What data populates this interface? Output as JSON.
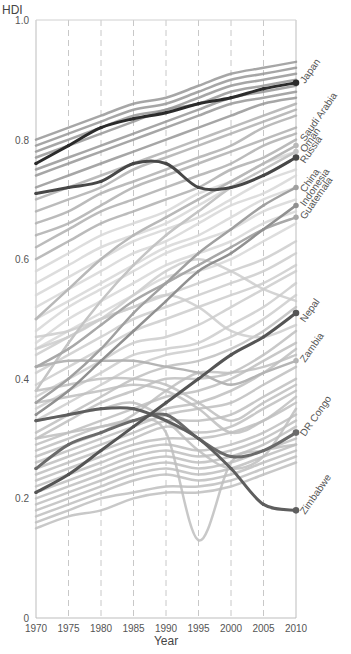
{
  "chart_data": {
    "type": "line",
    "title": "",
    "xlabel": "Year",
    "ylabel": "HDI",
    "xlim": [
      1970,
      2010
    ],
    "ylim": [
      0,
      1.0
    ],
    "x_ticks": [
      1970,
      1975,
      1980,
      1985,
      1990,
      1995,
      2000,
      2005,
      2010
    ],
    "y_ticks": [
      {
        "value": 0,
        "label": "0"
      },
      {
        "value": 0.2,
        "label": "0.2"
      },
      {
        "value": 0.4,
        "label": "0.4"
      },
      {
        "value": 0.6,
        "label": "0.6"
      },
      {
        "value": 0.8,
        "label": "0.8"
      },
      {
        "value": 1.0,
        "label": "1.0"
      }
    ],
    "grid": {
      "vertical_dashed": true,
      "horizontal": false
    },
    "legend": "direct labels at right end of highlighted lines, rotated 45°",
    "x": [
      1970,
      1975,
      1980,
      1985,
      1990,
      1995,
      2000,
      2005,
      2010
    ],
    "highlighted_series": [
      {
        "name": "Japan",
        "color": "#2b2b2b",
        "width": 3,
        "values": [
          0.76,
          0.79,
          0.82,
          0.835,
          0.845,
          0.86,
          0.87,
          0.885,
          0.895
        ]
      },
      {
        "name": "Saudi Arabia",
        "color": "#b8b8b8",
        "width": 2.5,
        "values": [
          0.5,
          0.55,
          0.6,
          0.64,
          0.67,
          0.7,
          0.73,
          0.76,
          0.79
        ]
      },
      {
        "name": "Oman",
        "color": "#c4c4c4",
        "width": 2.5,
        "values": [
          0.38,
          0.46,
          0.53,
          0.59,
          0.64,
          0.68,
          0.72,
          0.75,
          0.78
        ]
      },
      {
        "name": "Russia",
        "color": "#474747",
        "width": 3,
        "values": [
          0.71,
          0.72,
          0.73,
          0.76,
          0.76,
          0.72,
          0.72,
          0.74,
          0.77
        ]
      },
      {
        "name": "China",
        "color": "#a0a0a0",
        "width": 2.5,
        "values": [
          0.36,
          0.4,
          0.45,
          0.51,
          0.56,
          0.61,
          0.65,
          0.69,
          0.72
        ]
      },
      {
        "name": "Indonesia",
        "color": "#909090",
        "width": 2.5,
        "values": [
          0.34,
          0.38,
          0.43,
          0.48,
          0.53,
          0.58,
          0.61,
          0.65,
          0.69
        ]
      },
      {
        "name": "Guatemala",
        "color": "#a8a8a8",
        "width": 2.5,
        "values": [
          0.42,
          0.45,
          0.49,
          0.53,
          0.56,
          0.59,
          0.62,
          0.65,
          0.67
        ]
      },
      {
        "name": "Nepal",
        "color": "#555555",
        "width": 3,
        "values": [
          0.21,
          0.24,
          0.28,
          0.32,
          0.36,
          0.4,
          0.44,
          0.47,
          0.51
        ]
      },
      {
        "name": "Zambia",
        "color": "#b4b4b4",
        "width": 2.5,
        "values": [
          0.42,
          0.43,
          0.43,
          0.43,
          0.42,
          0.41,
          0.39,
          0.41,
          0.43
        ]
      },
      {
        "name": "DR Congo",
        "color": "#6b6b6b",
        "width": 3,
        "values": [
          0.25,
          0.29,
          0.31,
          0.33,
          0.34,
          0.3,
          0.27,
          0.28,
          0.31
        ]
      },
      {
        "name": "Zimbabwe",
        "color": "#5e5e5e",
        "width": 3,
        "values": [
          0.33,
          0.34,
          0.35,
          0.35,
          0.33,
          0.3,
          0.25,
          0.19,
          0.18
        ]
      }
    ],
    "highlight_markers_years": [
      1970,
      1975,
      1980,
      1985,
      1990,
      1995,
      2000,
      2005,
      2010
    ],
    "background_series_note": "many unlabeled gray lines for other countries, shaded from dark gray at top (high HDI) to light gray in middle",
    "background_series": [
      {
        "values": [
          0.8,
          0.82,
          0.84,
          0.86,
          0.87,
          0.89,
          0.91,
          0.92,
          0.93
        ]
      },
      {
        "values": [
          0.79,
          0.81,
          0.83,
          0.85,
          0.86,
          0.88,
          0.9,
          0.91,
          0.92
        ]
      },
      {
        "values": [
          0.78,
          0.8,
          0.82,
          0.84,
          0.85,
          0.87,
          0.89,
          0.9,
          0.91
        ]
      },
      {
        "values": [
          0.77,
          0.79,
          0.81,
          0.83,
          0.85,
          0.86,
          0.88,
          0.89,
          0.9
        ]
      },
      {
        "values": [
          0.75,
          0.77,
          0.79,
          0.81,
          0.83,
          0.85,
          0.87,
          0.88,
          0.89
        ]
      },
      {
        "values": [
          0.74,
          0.76,
          0.78,
          0.8,
          0.82,
          0.84,
          0.86,
          0.87,
          0.88
        ]
      },
      {
        "values": [
          0.72,
          0.74,
          0.76,
          0.78,
          0.8,
          0.82,
          0.84,
          0.86,
          0.87
        ]
      },
      {
        "values": [
          0.7,
          0.72,
          0.74,
          0.76,
          0.78,
          0.8,
          0.82,
          0.84,
          0.86
        ]
      },
      {
        "values": [
          0.68,
          0.7,
          0.72,
          0.75,
          0.77,
          0.79,
          0.81,
          0.83,
          0.85
        ]
      },
      {
        "values": [
          0.66,
          0.68,
          0.71,
          0.73,
          0.75,
          0.77,
          0.79,
          0.82,
          0.84
        ]
      },
      {
        "values": [
          0.64,
          0.66,
          0.69,
          0.72,
          0.74,
          0.76,
          0.78,
          0.8,
          0.82
        ]
      },
      {
        "values": [
          0.62,
          0.65,
          0.68,
          0.7,
          0.72,
          0.74,
          0.76,
          0.79,
          0.81
        ]
      },
      {
        "values": [
          0.6,
          0.63,
          0.66,
          0.68,
          0.7,
          0.72,
          0.75,
          0.77,
          0.8
        ]
      },
      {
        "values": [
          0.58,
          0.61,
          0.64,
          0.66,
          0.68,
          0.71,
          0.73,
          0.76,
          0.78
        ]
      },
      {
        "values": [
          0.56,
          0.59,
          0.62,
          0.64,
          0.66,
          0.69,
          0.72,
          0.74,
          0.77
        ]
      },
      {
        "values": [
          0.54,
          0.57,
          0.6,
          0.63,
          0.65,
          0.67,
          0.7,
          0.73,
          0.75
        ]
      },
      {
        "values": [
          0.52,
          0.55,
          0.58,
          0.61,
          0.63,
          0.66,
          0.69,
          0.71,
          0.74
        ]
      },
      {
        "values": [
          0.5,
          0.53,
          0.56,
          0.59,
          0.62,
          0.64,
          0.67,
          0.7,
          0.72
        ]
      },
      {
        "values": [
          0.48,
          0.52,
          0.55,
          0.58,
          0.61,
          0.63,
          0.65,
          0.68,
          0.7
        ]
      },
      {
        "values": [
          0.46,
          0.5,
          0.53,
          0.56,
          0.59,
          0.61,
          0.63,
          0.66,
          0.68
        ]
      },
      {
        "values": [
          0.45,
          0.48,
          0.51,
          0.54,
          0.57,
          0.58,
          0.6,
          0.63,
          0.66
        ]
      },
      {
        "values": [
          0.44,
          0.47,
          0.5,
          0.52,
          0.54,
          0.56,
          0.58,
          0.6,
          0.63
        ]
      },
      {
        "values": [
          0.41,
          0.44,
          0.47,
          0.5,
          0.52,
          0.54,
          0.56,
          0.58,
          0.61
        ]
      },
      {
        "values": [
          0.39,
          0.42,
          0.45,
          0.48,
          0.5,
          0.52,
          0.54,
          0.56,
          0.59
        ]
      },
      {
        "values": [
          0.37,
          0.4,
          0.43,
          0.46,
          0.47,
          0.49,
          0.52,
          0.55,
          0.58
        ]
      },
      {
        "values": [
          0.35,
          0.38,
          0.41,
          0.44,
          0.45,
          0.46,
          0.49,
          0.52,
          0.56
        ]
      },
      {
        "values": [
          0.33,
          0.36,
          0.39,
          0.42,
          0.44,
          0.45,
          0.47,
          0.5,
          0.54
        ]
      },
      {
        "values": [
          0.31,
          0.34,
          0.37,
          0.4,
          0.42,
          0.43,
          0.45,
          0.48,
          0.52
        ]
      },
      {
        "values": [
          0.3,
          0.33,
          0.36,
          0.38,
          0.4,
          0.4,
          0.41,
          0.44,
          0.48
        ]
      },
      {
        "values": [
          0.29,
          0.31,
          0.33,
          0.35,
          0.37,
          0.38,
          0.4,
          0.43,
          0.46
        ]
      },
      {
        "values": [
          0.28,
          0.3,
          0.32,
          0.33,
          0.35,
          0.36,
          0.38,
          0.41,
          0.45
        ]
      },
      {
        "values": [
          0.27,
          0.29,
          0.31,
          0.34,
          0.38,
          0.41,
          0.41,
          0.42,
          0.44
        ]
      },
      {
        "values": [
          0.26,
          0.28,
          0.3,
          0.32,
          0.34,
          0.35,
          0.36,
          0.39,
          0.42
        ]
      },
      {
        "values": [
          0.25,
          0.27,
          0.29,
          0.31,
          0.33,
          0.33,
          0.34,
          0.37,
          0.4
        ]
      },
      {
        "values": [
          0.24,
          0.26,
          0.28,
          0.3,
          0.32,
          0.31,
          0.32,
          0.35,
          0.38
        ]
      },
      {
        "values": [
          0.23,
          0.25,
          0.27,
          0.29,
          0.3,
          0.3,
          0.31,
          0.33,
          0.36
        ]
      },
      {
        "values": [
          0.22,
          0.24,
          0.26,
          0.28,
          0.29,
          0.28,
          0.29,
          0.31,
          0.34
        ]
      },
      {
        "values": [
          0.21,
          0.23,
          0.25,
          0.27,
          0.28,
          0.27,
          0.28,
          0.3,
          0.33
        ]
      },
      {
        "values": [
          0.2,
          0.22,
          0.24,
          0.26,
          0.27,
          0.26,
          0.27,
          0.29,
          0.32
        ]
      },
      {
        "values": [
          0.19,
          0.21,
          0.23,
          0.25,
          0.26,
          0.25,
          0.26,
          0.28,
          0.3
        ]
      },
      {
        "values": [
          0.18,
          0.2,
          0.22,
          0.24,
          0.25,
          0.24,
          0.25,
          0.27,
          0.29
        ]
      },
      {
        "values": [
          0.17,
          0.19,
          0.21,
          0.23,
          0.24,
          0.23,
          0.24,
          0.26,
          0.28
        ]
      },
      {
        "values": [
          0.16,
          0.18,
          0.2,
          0.21,
          0.22,
          0.22,
          0.23,
          0.25,
          0.27
        ]
      },
      {
        "values": [
          0.15,
          0.17,
          0.18,
          0.2,
          0.21,
          0.21,
          0.22,
          0.24,
          0.26
        ]
      },
      {
        "values": [
          0.3,
          0.31,
          0.32,
          0.33,
          0.31,
          0.13,
          0.26,
          0.28,
          0.29
        ]
      },
      {
        "values": [
          0.38,
          0.39,
          0.4,
          0.4,
          0.39,
          0.36,
          0.33,
          0.36,
          0.39
        ]
      },
      {
        "values": [
          0.36,
          0.37,
          0.38,
          0.39,
          0.38,
          0.35,
          0.31,
          0.33,
          0.37
        ]
      },
      {
        "values": [
          0.33,
          0.34,
          0.35,
          0.36,
          0.33,
          0.28,
          0.25,
          0.27,
          0.35
        ]
      },
      {
        "values": [
          0.47,
          0.48,
          0.5,
          0.52,
          0.54,
          0.52,
          0.48,
          0.47,
          0.49
        ]
      },
      {
        "values": [
          0.45,
          0.47,
          0.5,
          0.54,
          0.58,
          0.6,
          0.58,
          0.55,
          0.53
        ]
      }
    ]
  }
}
